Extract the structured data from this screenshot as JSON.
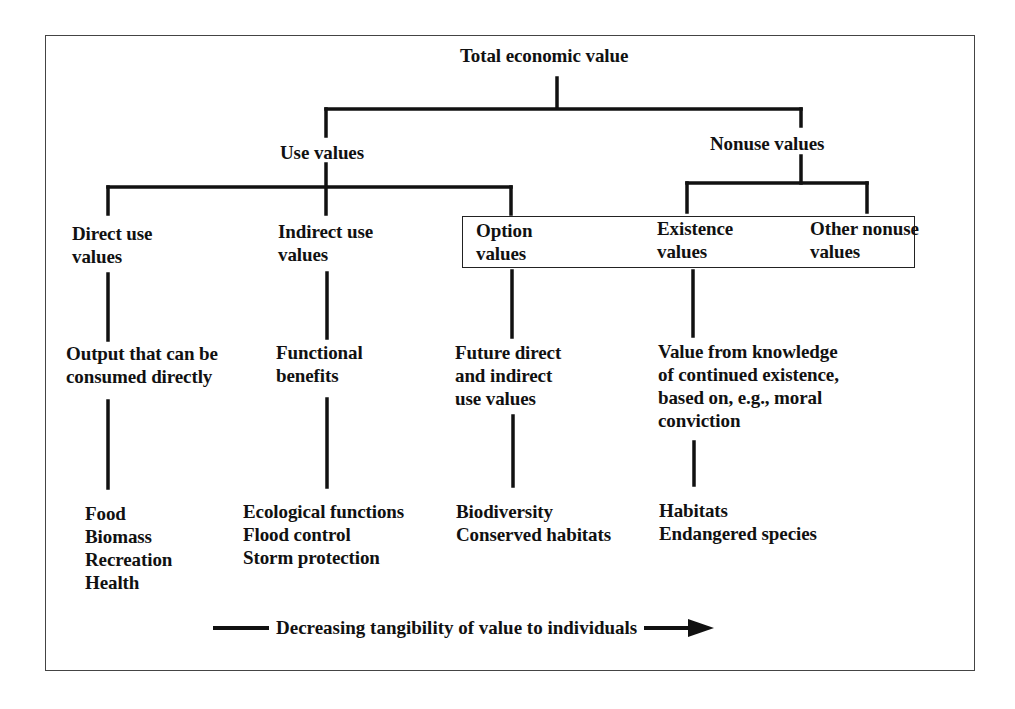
{
  "diagram": {
    "root": {
      "label": "Total economic value"
    },
    "level1": {
      "use": {
        "label": "Use values"
      },
      "nonuse": {
        "label": "Nonuse values"
      }
    },
    "categories": [
      {
        "id": "direct",
        "line1": "Direct use",
        "line2": "values",
        "parent": "Use values"
      },
      {
        "id": "indirect",
        "line1": "Indirect use",
        "line2": "values",
        "parent": "Use values"
      },
      {
        "id": "option",
        "line1": "Option",
        "line2": "values",
        "parent": "Use values"
      },
      {
        "id": "existence",
        "line1": "Existence",
        "line2": "values",
        "parent": "Nonuse values"
      },
      {
        "id": "other",
        "line1": "Other nonuse",
        "line2": "values",
        "parent": "Nonuse values"
      }
    ],
    "descriptions": {
      "direct": {
        "lines": [
          "Output that can be",
          "consumed directly"
        ]
      },
      "indirect": {
        "lines": [
          "Functional",
          "benefits"
        ]
      },
      "option": {
        "lines": [
          "Future direct",
          "and indirect",
          "use values"
        ]
      },
      "existence": {
        "lines": [
          "Value from knowledge",
          "of continued existence,",
          "based on, e.g., moral",
          "conviction"
        ]
      }
    },
    "examples": {
      "direct": {
        "items": [
          "Food",
          "Biomass",
          "Recreation",
          "Health"
        ]
      },
      "indirect": {
        "items": [
          "Ecological functions",
          "Flood control",
          "Storm protection"
        ]
      },
      "option": {
        "items": [
          "Biodiversity",
          "Conserved habitats"
        ]
      },
      "existence": {
        "items": [
          "Habitats",
          "Endangered species"
        ]
      }
    },
    "footer": {
      "label": "Decreasing tangibility of value to individuals"
    },
    "colors": {
      "line": "#111111",
      "frame": "#444444",
      "background": "#ffffff"
    }
  }
}
